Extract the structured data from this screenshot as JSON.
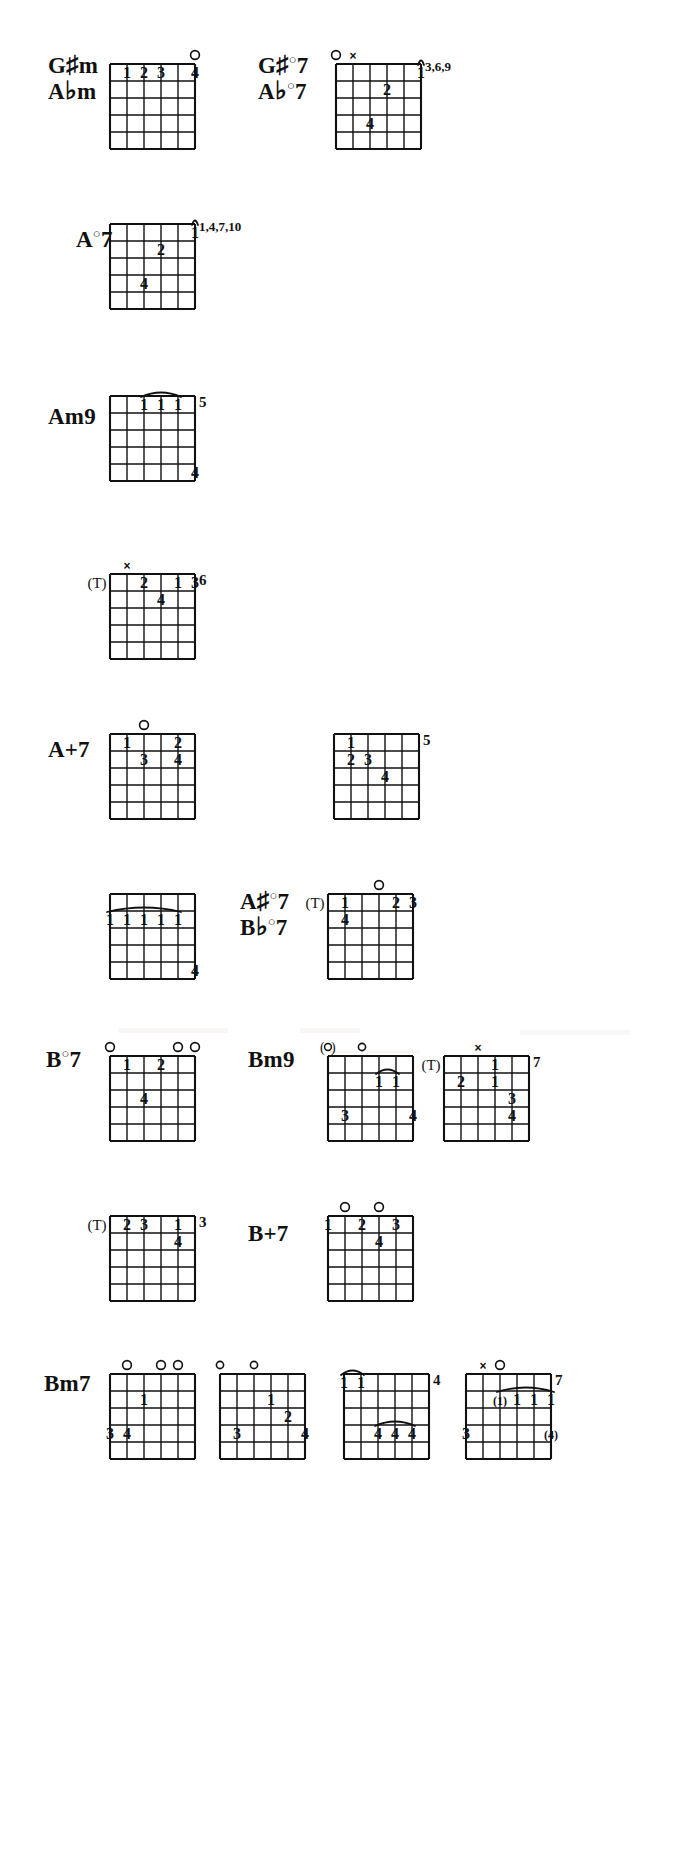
{
  "page": {
    "width": 673,
    "height": 1862,
    "background": "#ffffff",
    "ink": "#111111",
    "grid": {
      "strings": 6,
      "frets": 5
    }
  },
  "symbols": {
    "open": "O",
    "open_small": "o",
    "open_parenthesized": "(O)",
    "muted": "x",
    "thumb": "(T)",
    "thumb_letter": "T",
    "barre": "curved-arc",
    "finger_1": "1",
    "finger_2": "2",
    "finger_3": "3",
    "finger_4": "4"
  },
  "rows": [
    {
      "id": "row-gsharp-m",
      "y": 18,
      "labels": [
        {
          "id": "label-gsharpm",
          "x": 48,
          "y": 52,
          "lines": [
            "G#m",
            "Abm"
          ],
          "text": "G#m / Abm"
        }
      ],
      "diagrams": [
        {
          "id": "diagram-gsharpm-1",
          "x": 96,
          "y": 38,
          "w": 92,
          "h": 100,
          "fret_number": "",
          "markers": [
            {
              "type": "open",
              "string": 5,
              "label": "O"
            }
          ],
          "fingers": [
            {
              "string": 1,
              "fret": 1,
              "label": "1"
            },
            {
              "string": 2,
              "fret": 1,
              "label": "2"
            },
            {
              "string": 3,
              "fret": 1,
              "label": "3"
            },
            {
              "string": 5,
              "fret": 1,
              "label": "4"
            }
          ],
          "barres": []
        }
      ]
    },
    {
      "id": "row-gsharp-dim7",
      "y": 18,
      "labels": [
        {
          "id": "label-gsharpdim7",
          "x": 258,
          "y": 52,
          "lines": [
            "G#°7",
            "Ab°7"
          ],
          "text": "G#°7 / Ab°7"
        }
      ],
      "diagrams": [
        {
          "id": "diagram-gsharpdim7-1",
          "x": 322,
          "y": 38,
          "w": 92,
          "h": 100,
          "fret_number": "3,6,\n9",
          "fret_number_lines": [
            "3,6,",
            "9"
          ],
          "markers": [
            {
              "type": "open",
              "string": 0,
              "label": "O"
            },
            {
              "type": "muted",
              "string": 1,
              "label": "x"
            }
          ],
          "fingers": [
            {
              "string": 5,
              "fret": 1,
              "label": "1"
            },
            {
              "string": 3,
              "fret": 2,
              "label": "2"
            },
            {
              "string": 2,
              "fret": 4,
              "label": "4"
            }
          ],
          "barres": [
            {
              "fret": 1,
              "from": 5,
              "to": 5
            }
          ]
        }
      ]
    },
    {
      "id": "row-a-dim7",
      "y": 192,
      "labels": [
        {
          "id": "label-adim7",
          "x": 76,
          "y": 228,
          "lines": [
            "A°7"
          ],
          "text": "A°7"
        }
      ],
      "diagrams": [
        {
          "id": "diagram-adim7-1",
          "x": 96,
          "y": 198,
          "w": 92,
          "h": 100,
          "fret_number_lines": [
            "1,4,",
            "7,10"
          ],
          "markers": [],
          "fingers": [
            {
              "string": 5,
              "fret": 1,
              "label": "1"
            },
            {
              "string": 3,
              "fret": 2,
              "label": "2"
            },
            {
              "string": 2,
              "fret": 4,
              "label": "4"
            }
          ],
          "barres": [
            {
              "fret": 1,
              "from": 5,
              "to": 5
            }
          ]
        }
      ]
    },
    {
      "id": "row-am9",
      "y": 365,
      "labels": [
        {
          "id": "label-am9",
          "x": 48,
          "y": 405,
          "lines": [
            "Am9"
          ],
          "text": "Am9"
        }
      ],
      "diagrams": [
        {
          "id": "diagram-am9-1",
          "x": 96,
          "y": 370,
          "w": 92,
          "h": 100,
          "fret_number": "5",
          "markers": [],
          "fingers": [
            {
              "string": 2,
              "fret": 1,
              "label": "1"
            },
            {
              "string": 3,
              "fret": 1,
              "label": "1"
            },
            {
              "string": 4,
              "fret": 1,
              "label": "1"
            },
            {
              "string": 5,
              "fret": 5,
              "label": "4"
            }
          ],
          "barres": [
            {
              "fret": 1,
              "from": 2,
              "to": 4
            }
          ]
        }
      ]
    },
    {
      "id": "row-am9-b",
      "y": 540,
      "labels": [],
      "diagrams": [
        {
          "id": "diagram-am9-2",
          "x": 96,
          "y": 548,
          "w": 92,
          "h": 100,
          "fret_number": "6",
          "markers": [
            {
              "type": "muted",
              "string": 1,
              "label": "x"
            },
            {
              "type": "thumb",
              "string": 0,
              "label": "(T)"
            }
          ],
          "fingers": [
            {
              "string": 2,
              "fret": 1,
              "label": "2"
            },
            {
              "string": 4,
              "fret": 1,
              "label": "1"
            },
            {
              "string": 5,
              "fret": 1,
              "label": "3"
            },
            {
              "string": 3,
              "fret": 2,
              "label": "4"
            }
          ],
          "barres": []
        }
      ]
    },
    {
      "id": "row-aplus7",
      "y": 700,
      "labels": [
        {
          "id": "label-aplus7",
          "x": 48,
          "y": 738,
          "lines": [
            "A+7"
          ],
          "text": "A+7"
        }
      ],
      "diagrams": [
        {
          "id": "diagram-aplus7-1",
          "x": 96,
          "y": 708,
          "w": 92,
          "h": 100,
          "fret_number": "",
          "markers": [
            {
              "type": "open",
              "string": 2,
              "label": "O"
            }
          ],
          "fingers": [
            {
              "string": 1,
              "fret": 1,
              "label": "1"
            },
            {
              "string": 4,
              "fret": 1,
              "label": "2"
            },
            {
              "string": 2,
              "fret": 2,
              "label": "3"
            },
            {
              "string": 4,
              "fret": 2,
              "label": "4"
            }
          ],
          "barres": []
        },
        {
          "id": "diagram-aplus7-2",
          "x": 320,
          "y": 708,
          "w": 92,
          "h": 100,
          "fret_number": "5",
          "markers": [],
          "fingers": [
            {
              "string": 1,
              "fret": 1,
              "label": "1"
            },
            {
              "string": 1,
              "fret": 2,
              "label": "2"
            },
            {
              "string": 2,
              "fret": 2,
              "label": "3"
            },
            {
              "string": 3,
              "fret": 3,
              "label": "4"
            }
          ],
          "barres": []
        }
      ]
    },
    {
      "id": "row-asharp-dim7",
      "y": 865,
      "labels": [
        {
          "id": "label-asharpdim7",
          "x": 240,
          "y": 888,
          "lines": [
            "A#°7",
            "Bb°7"
          ],
          "text": "A#°7 / Bb°7"
        }
      ],
      "diagrams": [
        {
          "id": "diagram-asharpdim7-left",
          "x": 96,
          "y": 868,
          "w": 92,
          "h": 100,
          "fret_number": "",
          "markers": [],
          "fingers": [
            {
              "string": 0,
              "fret": 2,
              "label": "1"
            },
            {
              "string": 1,
              "fret": 2,
              "label": "1"
            },
            {
              "string": 2,
              "fret": 2,
              "label": "1"
            },
            {
              "string": 3,
              "fret": 2,
              "label": "1"
            },
            {
              "string": 4,
              "fret": 2,
              "label": "1"
            },
            {
              "string": 5,
              "fret": 5,
              "label": "4"
            }
          ],
          "barres": [
            {
              "fret": 2,
              "from": 0,
              "to": 4
            }
          ]
        },
        {
          "id": "diagram-asharpdim7-right",
          "x": 314,
          "y": 868,
          "w": 92,
          "h": 100,
          "fret_number": "",
          "markers": [
            {
              "type": "open",
              "string": 3,
              "label": "O"
            },
            {
              "type": "thumb",
              "string": 0,
              "label": "(T)"
            }
          ],
          "fingers": [
            {
              "string": 1,
              "fret": 1,
              "label": "1"
            },
            {
              "string": 4,
              "fret": 1,
              "label": "2"
            },
            {
              "string": 5,
              "fret": 1,
              "label": "3"
            },
            {
              "string": 1,
              "fret": 2,
              "label": "4"
            }
          ],
          "barres": []
        }
      ]
    },
    {
      "id": "row-bdim7-bm9",
      "y": 1025,
      "labels": [
        {
          "id": "label-bdim7",
          "x": 46,
          "y": 1048,
          "lines": [
            "B°7"
          ],
          "text": "B°7"
        },
        {
          "id": "label-bm9",
          "x": 248,
          "y": 1048,
          "lines": [
            "Bm9"
          ],
          "text": "Bm9"
        }
      ],
      "diagrams": [
        {
          "id": "diagram-bdim7-1",
          "x": 96,
          "y": 1030,
          "w": 92,
          "h": 100,
          "fret_number": "",
          "markers": [
            {
              "type": "open",
              "string": 0,
              "label": "O"
            },
            {
              "type": "open",
              "string": 4,
              "label": "O"
            },
            {
              "type": "open",
              "string": 5,
              "label": "O"
            }
          ],
          "fingers": [
            {
              "string": 1,
              "fret": 1,
              "label": "1"
            },
            {
              "string": 3,
              "fret": 1,
              "label": "2"
            },
            {
              "string": 2,
              "fret": 3,
              "label": "4"
            }
          ],
          "barres": []
        },
        {
          "id": "diagram-bm9-1",
          "x": 314,
          "y": 1030,
          "w": 92,
          "h": 100,
          "fret_number": "",
          "markers": [
            {
              "type": "open_paren",
              "string": 0,
              "label": "(o)"
            },
            {
              "type": "open",
              "string": 2,
              "label": "o"
            }
          ],
          "fingers": [
            {
              "string": 3,
              "fret": 2,
              "label": "1"
            },
            {
              "string": 4,
              "fret": 2,
              "label": "1"
            },
            {
              "string": 1,
              "fret": 4,
              "label": "3"
            },
            {
              "string": 5,
              "fret": 4,
              "label": "4"
            }
          ],
          "barres": [
            {
              "fret": 2,
              "from": 3,
              "to": 4
            }
          ]
        },
        {
          "id": "diagram-bm9-2",
          "x": 430,
          "y": 1030,
          "w": 92,
          "h": 100,
          "fret_number": "7",
          "markers": [
            {
              "type": "muted",
              "string": 2,
              "label": "x"
            },
            {
              "type": "thumb",
              "string": 0,
              "label": "(T)"
            }
          ],
          "fingers": [
            {
              "string": 3,
              "fret": 1,
              "label": "1"
            },
            {
              "string": 1,
              "fret": 2,
              "label": "2"
            },
            {
              "string": 3,
              "fret": 2,
              "label": "1"
            },
            {
              "string": 4,
              "fret": 3,
              "label": "3"
            },
            {
              "string": 4,
              "fret": 4,
              "label": "4"
            }
          ],
          "barres": []
        }
      ]
    },
    {
      "id": "row-bplus7",
      "y": 1185,
      "labels": [
        {
          "id": "label-bplus7",
          "x": 248,
          "y": 1222,
          "lines": [
            "B+7"
          ],
          "text": "B+7"
        }
      ],
      "diagrams": [
        {
          "id": "diagram-bplus7-left",
          "x": 96,
          "y": 1190,
          "w": 92,
          "h": 100,
          "fret_number": "3",
          "markers": [
            {
              "type": "thumb",
              "string": 0,
              "label": "(T)"
            }
          ],
          "fingers": [
            {
              "string": 1,
              "fret": 1,
              "label": "2"
            },
            {
              "string": 2,
              "fret": 1,
              "label": "3"
            },
            {
              "string": 4,
              "fret": 1,
              "label": "1"
            },
            {
              "string": 4,
              "fret": 2,
              "label": "4"
            }
          ],
          "barres": []
        },
        {
          "id": "diagram-bplus7-right",
          "x": 314,
          "y": 1190,
          "w": 92,
          "h": 100,
          "fret_number": "",
          "markers": [
            {
              "type": "open",
              "string": 1,
              "label": "O"
            },
            {
              "type": "open",
              "string": 3,
              "label": "O"
            }
          ],
          "fingers": [
            {
              "string": 0,
              "fret": 1,
              "label": "1"
            },
            {
              "string": 2,
              "fret": 1,
              "label": "2"
            },
            {
              "string": 4,
              "fret": 1,
              "label": "3"
            },
            {
              "string": 3,
              "fret": 2,
              "label": "4"
            }
          ],
          "barres": []
        }
      ]
    },
    {
      "id": "row-bm7",
      "y": 1335,
      "labels": [
        {
          "id": "label-bm7",
          "x": 44,
          "y": 1372,
          "lines": [
            "Bm7"
          ],
          "text": "Bm7"
        }
      ],
      "diagrams": [
        {
          "id": "diagram-bm7-1",
          "x": 96,
          "y": 1348,
          "w": 92,
          "h": 100,
          "fret_number": "",
          "markers": [
            {
              "type": "open",
              "string": 1,
              "label": "O"
            },
            {
              "type": "open",
              "string": 3,
              "label": "O"
            },
            {
              "type": "open",
              "string": 4,
              "label": "O"
            }
          ],
          "fingers": [
            {
              "string": 2,
              "fret": 2,
              "label": "1"
            },
            {
              "string": 0,
              "fret": 4,
              "label": "3"
            },
            {
              "string": 1,
              "fret": 4,
              "label": "4"
            }
          ],
          "barres": []
        },
        {
          "id": "diagram-bm7-2",
          "x": 206,
          "y": 1348,
          "w": 92,
          "h": 100,
          "fret_number": "",
          "markers": [
            {
              "type": "open",
              "string": 0,
              "label": "o"
            },
            {
              "type": "open",
              "string": 2,
              "label": "o"
            }
          ],
          "fingers": [
            {
              "string": 3,
              "fret": 2,
              "label": "1"
            },
            {
              "string": 4,
              "fret": 3,
              "label": "2"
            },
            {
              "string": 1,
              "fret": 4,
              "label": "3"
            },
            {
              "string": 5,
              "fret": 4,
              "label": "4"
            }
          ],
          "barres": []
        },
        {
          "id": "diagram-bm7-3",
          "x": 330,
          "y": 1348,
          "w": 92,
          "h": 100,
          "fret_number": "4",
          "markers": [],
          "fingers": [
            {
              "string": 0,
              "fret": 1,
              "label": "1"
            },
            {
              "string": 1,
              "fret": 1,
              "label": "1"
            },
            {
              "string": 2,
              "fret": 4,
              "label": "4"
            },
            {
              "string": 3,
              "fret": 4,
              "label": "4"
            },
            {
              "string": 4,
              "fret": 4,
              "label": "4"
            }
          ],
          "barres": [
            {
              "fret": 1,
              "from": 0,
              "to": 1
            },
            {
              "fret": 4,
              "from": 2,
              "to": 4
            }
          ]
        },
        {
          "id": "diagram-bm7-4",
          "x": 452,
          "y": 1348,
          "w": 110,
          "h": 100,
          "fret_number": "7",
          "markers": [
            {
              "type": "muted",
              "string": 1,
              "label": "x"
            },
            {
              "type": "open",
              "string": 2,
              "label": "O"
            }
          ],
          "fingers": [
            {
              "string": 0,
              "fret": 4,
              "label": "3"
            },
            {
              "string": 2,
              "fret": 2,
              "label": "(1)"
            },
            {
              "string": 3,
              "fret": 2,
              "label": "1"
            },
            {
              "string": 4,
              "fret": 2,
              "label": "1"
            },
            {
              "string": 5,
              "fret": 2,
              "label": "1"
            },
            {
              "string": 5,
              "fret": 4,
              "label": "(4)"
            }
          ],
          "barres": [
            {
              "fret": 2,
              "from": 2,
              "to": 5
            }
          ]
        }
      ]
    }
  ]
}
